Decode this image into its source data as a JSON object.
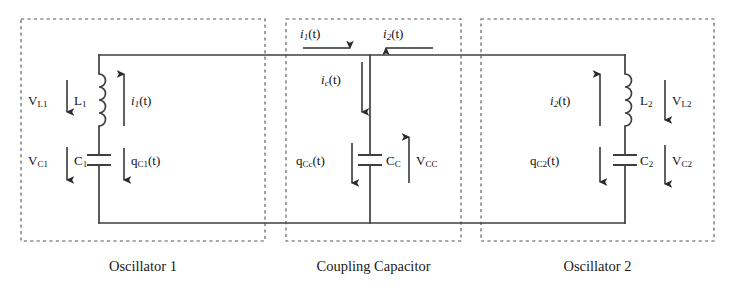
{
  "diagram": {
    "type": "circuit-schematic",
    "stroke_color": "#3a3a3a",
    "dash_color": "#555555",
    "text_color": "#111111"
  },
  "sections": [
    {
      "id": "oscillator-1",
      "caption": "Oscillator 1",
      "box": {
        "x": 21,
        "y": 19,
        "w": 244,
        "h": 222
      }
    },
    {
      "id": "coupling-capacitor",
      "caption": "Coupling Capacitor",
      "box": {
        "x": 286,
        "y": 19,
        "w": 175,
        "h": 222
      }
    },
    {
      "id": "oscillator-2",
      "caption": "Oscillator 2",
      "box": {
        "x": 481,
        "y": 19,
        "w": 233,
        "h": 222
      }
    }
  ],
  "labels": {
    "v_l1": {
      "main": "V",
      "sub": "L1"
    },
    "l1": {
      "main": "L",
      "sub": "1"
    },
    "i1_left": {
      "main": "i",
      "sub": "1",
      "tail": "(t)"
    },
    "v_c1": {
      "main": "V",
      "sub": "C1"
    },
    "c1": {
      "main": "C",
      "sub": "1"
    },
    "q_c1": {
      "main": "q",
      "sub": "C1",
      "tail": "(t)"
    },
    "i1_mid": {
      "main": "i",
      "sub": "1",
      "tail": "(t)"
    },
    "i2_mid": {
      "main": "i",
      "sub": "2",
      "tail": "(t)"
    },
    "ic": {
      "main": "i",
      "sub": "c",
      "tail": "(t)"
    },
    "q_cc": {
      "main": "q",
      "sub": "Cc",
      "tail": "(t)"
    },
    "cc": {
      "main": "C",
      "sub": "C"
    },
    "v_cc": {
      "main": "V",
      "sub": "CC"
    },
    "i2_right": {
      "main": "i",
      "sub": "2",
      "tail": "(t)"
    },
    "l2": {
      "main": "L",
      "sub": "2"
    },
    "v_l2": {
      "main": "V",
      "sub": "L2"
    },
    "q_c2": {
      "main": "q",
      "sub": "C2",
      "tail": "(t)"
    },
    "c2": {
      "main": "C",
      "sub": "2"
    },
    "v_c2": {
      "main": "V",
      "sub": "C2"
    }
  },
  "components": [
    {
      "name": "inductor-l1",
      "section": "oscillator-1",
      "kind": "inductor",
      "x": 99,
      "y_top": 74,
      "y_bottom": 126
    },
    {
      "name": "capacitor-c1",
      "section": "oscillator-1",
      "kind": "capacitor",
      "x": 99,
      "y": 160
    },
    {
      "name": "capacitor-cc",
      "section": "coupling-capacitor",
      "kind": "capacitor",
      "x": 370,
      "y": 160
    },
    {
      "name": "inductor-l2",
      "section": "oscillator-2",
      "kind": "inductor",
      "x": 625,
      "y_top": 74,
      "y_bottom": 126
    },
    {
      "name": "capacitor-c2",
      "section": "oscillator-2",
      "kind": "capacitor",
      "x": 625,
      "y": 160
    }
  ],
  "currents": [
    {
      "name": "i1-branch-arrow",
      "direction": "up",
      "x": 124,
      "y_from": 126,
      "y_to": 74
    },
    {
      "name": "i1-top-arrow",
      "direction": "right",
      "y": 48,
      "x_from": 303,
      "x_to": 350
    },
    {
      "name": "i2-top-arrow",
      "direction": "left",
      "y": 48,
      "x_from": 433,
      "x_to": 386
    },
    {
      "name": "ic-arrow",
      "direction": "down",
      "x": 362,
      "y_from": 62,
      "y_to": 112
    },
    {
      "name": "i2-branch-arrow",
      "direction": "up",
      "x": 600,
      "y_from": 126,
      "y_to": 74
    }
  ]
}
